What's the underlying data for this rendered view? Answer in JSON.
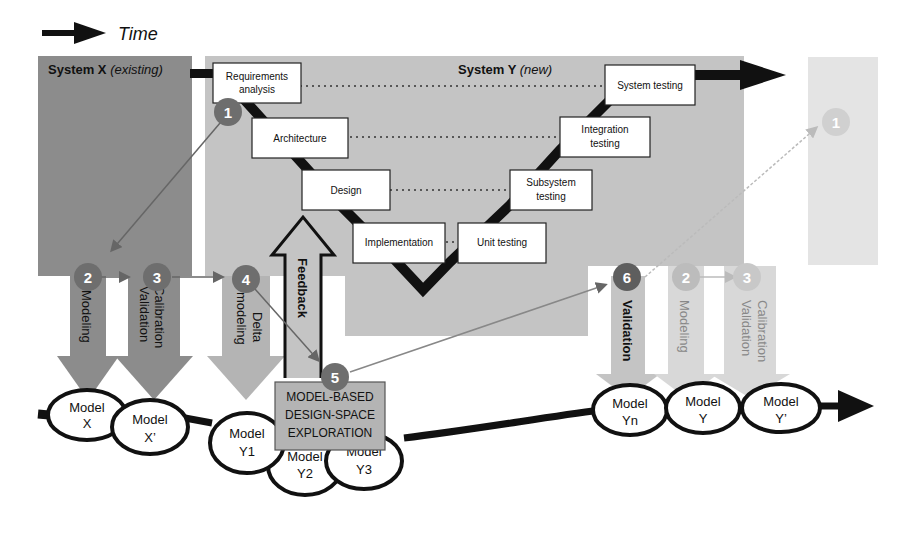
{
  "legend": {
    "arrow_icon": "right-arrow",
    "label": "Time"
  },
  "system_x": {
    "title": "System X",
    "qualifier": "(existing)"
  },
  "system_y": {
    "title": "System Y",
    "qualifier": "(new)"
  },
  "v_model": {
    "left": [
      "Requirements analysis",
      "Architecture",
      "Design",
      "Implementation"
    ],
    "right": [
      "Unit testing",
      "Subsystem testing",
      "Integration testing",
      "System testing"
    ],
    "boxes": {
      "req1": "Requirements",
      "req2": "analysis",
      "arch": "Architecture",
      "design": "Design",
      "impl": "Implementation",
      "unit": "Unit testing",
      "sub1": "Subsystem",
      "sub2": "testing",
      "int1": "Integration",
      "int2": "testing",
      "sys": "System testing"
    }
  },
  "steps": {
    "s1": "1",
    "s2": "2",
    "s3": "3",
    "s4": "4",
    "s5": "5",
    "s6": "6",
    "s1_future": "1",
    "s2_future": "2",
    "s3_future": "3"
  },
  "activities": {
    "modeling": "Modeling",
    "calibration": "Calibration",
    "validation": "Validation",
    "delta1": "Delta",
    "delta2": "modeling",
    "feedback": "Feedback",
    "validation_y": "Validation",
    "modeling_future": "Modeling",
    "calibration_future": "Calibration",
    "validation_future": "Validation"
  },
  "mbdse": {
    "line1": "MODEL-BASED",
    "line2": "DESIGN-SPACE",
    "line3": "EXPLORATION"
  },
  "models": {
    "x": {
      "l1": "Model",
      "l2": "X"
    },
    "xp": {
      "l1": "Model",
      "l2": "X’"
    },
    "y1": {
      "l1": "Model",
      "l2": "Y1"
    },
    "y2": {
      "l1": "Model",
      "l2": "Y2"
    },
    "y3": {
      "l1": "Model",
      "l2": "Y3"
    },
    "yn": {
      "l1": "Model",
      "l2": "Yn"
    },
    "y": {
      "l1": "Model",
      "l2": "Y"
    },
    "yp": {
      "l1": "Model",
      "l2": "Y’"
    }
  },
  "colors": {
    "system_x_bg": "#8c8c8c",
    "system_y_bg": "#c4c4c4",
    "future_bg": "#e4e4e4",
    "badge": "#6e6e6e",
    "badge_light": "#b8b8b8",
    "mbdse_bg": "#b4b4b4"
  }
}
